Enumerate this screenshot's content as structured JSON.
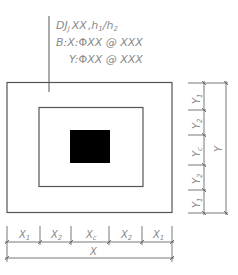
{
  "drawing": {
    "type": "foundation-plan-detail",
    "colors": {
      "line": "#555555",
      "text": "#8a8a8a",
      "column": "#000000",
      "background": "#ffffff"
    },
    "annotation": {
      "line1_prefix": "DJ",
      "line1_sub": "J",
      "line1_code": "XX",
      "line1_heights": ",h",
      "line1_h1_sub": "1",
      "line1_slash": "/h",
      "line1_h2_sub": "2",
      "line2": "B:X: ⲀXX@XXX",
      "line2_prefix": "B:X:",
      "line2_rebar_symbol": "Φ",
      "line2_value": "XX @ XXX",
      "line3_prefix": "Y:",
      "line3_rebar_symbol": "Φ",
      "line3_value": "XX @ XXX"
    },
    "x_dimensions": {
      "segments": [
        {
          "label": "X",
          "sub": "1"
        },
        {
          "label": "X",
          "sub": "2"
        },
        {
          "label": "X",
          "sub": "c"
        },
        {
          "label": "X",
          "sub": "2"
        },
        {
          "label": "X",
          "sub": "1"
        }
      ],
      "total": {
        "label": "X"
      }
    },
    "y_dimensions": {
      "segments": [
        {
          "label": "Y",
          "sub": "1"
        },
        {
          "label": "Y",
          "sub": "2"
        },
        {
          "label": "Y",
          "sub": "c"
        },
        {
          "label": "Y",
          "sub": "2"
        },
        {
          "label": "Y",
          "sub": "1"
        }
      ],
      "total": {
        "label": "Y"
      }
    }
  }
}
